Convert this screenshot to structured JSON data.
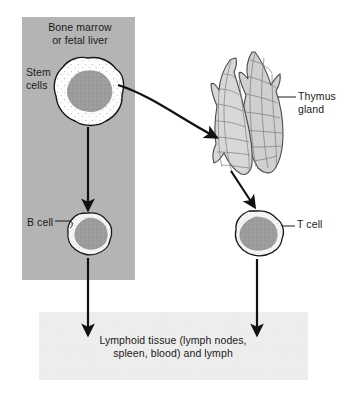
{
  "figure": {
    "type": "biological-flow-diagram"
  },
  "panels": {
    "source": {
      "label": "Bone marrow\nor fetal liver",
      "fill": "#b3b3b3",
      "x": 22,
      "y": 17,
      "w": 113,
      "h": 263
    },
    "destination": {
      "label": "Lymphoid tissue (lymph nodes,\nspleen, blood) and lymph",
      "fill": "#ededed",
      "x": 39,
      "y": 312,
      "w": 269,
      "h": 68
    }
  },
  "cells": [
    {
      "name": "stem-cell",
      "label": "Stem\ncells",
      "cytoplasm_color": "#fdfdfd",
      "nucleus_color": "#9a9a9a",
      "cx": 88,
      "cy": 92,
      "r": 32
    },
    {
      "name": "b-cell",
      "label": "B cell",
      "cytoplasm_color": "#f2f2f2",
      "nucleus_color": "#9a9a9a",
      "cx": 88,
      "cy": 233,
      "r": 20
    },
    {
      "name": "t-cell",
      "label": "T cell",
      "cytoplasm_color": "#f2f2f2",
      "nucleus_color": "#9a9a9a",
      "cx": 256,
      "cy": 233,
      "r": 21
    }
  ],
  "organs": [
    {
      "name": "thymus-gland",
      "label": "Thymus\ngland",
      "fill": "#d4d4d4",
      "stroke": "#4a4a4a",
      "lobes": 2,
      "x": 212,
      "y": 48,
      "w": 72,
      "h": 128
    }
  ],
  "arrows": [
    {
      "name": "stem-to-thymus-arrow",
      "kind": "curved",
      "from": "stem-cell",
      "to": "thymus-gland"
    },
    {
      "name": "stem-to-bcell-arrow",
      "kind": "straight-vertical",
      "from": "stem-cell",
      "to": "b-cell"
    },
    {
      "name": "thymus-to-tcell-arrow",
      "kind": "straight-diagonal",
      "from": "thymus-gland",
      "to": "t-cell"
    },
    {
      "name": "bcell-to-lymphoid-arrow",
      "kind": "straight-vertical",
      "from": "b-cell",
      "to": "destination"
    },
    {
      "name": "tcell-to-lymphoid-arrow",
      "kind": "straight-vertical",
      "from": "t-cell",
      "to": "destination"
    }
  ],
  "leader_lines": [
    {
      "name": "b-cell-leader",
      "label_ref": "b-cell"
    },
    {
      "name": "t-cell-leader",
      "label_ref": "t-cell"
    },
    {
      "name": "thymus-gland-leader",
      "label_ref": "thymus-gland"
    }
  ],
  "colors": {
    "panel_gray": "#b3b3b3",
    "box_light_gray": "#ededed",
    "nucleus_gray": "#9a9a9a",
    "organ_gray": "#d4d4d4",
    "ink": "#111111",
    "text": "#1a1a1a"
  }
}
